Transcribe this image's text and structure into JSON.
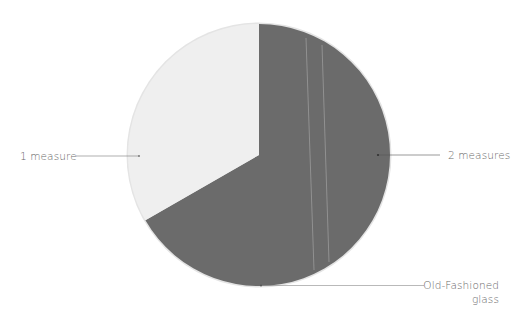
{
  "chart_data": {
    "type": "pie",
    "title": "",
    "start_angle_deg": 0,
    "direction": "clockwise",
    "slices": [
      {
        "label": "2 measures",
        "value": 66.7,
        "color": "#6b6b6b"
      },
      {
        "label": "1 measure",
        "value": 33.3,
        "color": "#efefef"
      }
    ],
    "annotations": [
      {
        "text": "Old-Fashioned glass",
        "target": "pie bottom edge"
      }
    ],
    "center": [
      259,
      155
    ],
    "radius": 131,
    "edge_color": "#e6e6e6",
    "stripe_color": "#d9d9d9"
  },
  "labels": {
    "one_measure": "1 measure",
    "two_measures": "2 measures",
    "glass_line1": "Old-Fashioned",
    "glass_line2": "glass"
  }
}
